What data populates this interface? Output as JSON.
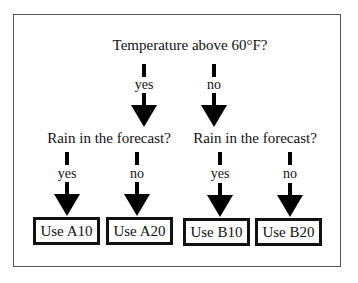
{
  "diagram": {
    "type": "decision-tree",
    "root": {
      "question": "Temperature above 60°F?",
      "branches": [
        {
          "label": "yes",
          "question": "Rain in the forecast?",
          "branches": [
            {
              "label": "yes",
              "outcome": "Use A10"
            },
            {
              "label": "no",
              "outcome": "Use A20"
            }
          ]
        },
        {
          "label": "no",
          "question": "Rain in the forecast?",
          "branches": [
            {
              "label": "yes",
              "outcome": "Use B10"
            },
            {
              "label": "no",
              "outcome": "Use B20"
            }
          ]
        }
      ]
    },
    "colors": {
      "arrow": "#000000",
      "text": "#111111",
      "frame": "#555555"
    }
  }
}
